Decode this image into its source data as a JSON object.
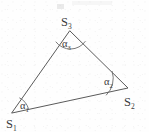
{
  "figure": {
    "background_color": "#fefefe",
    "line_color": "#5a5a5a",
    "text_color": "#3a3a3a",
    "width": 149,
    "height": 132
  },
  "vertices": [
    {
      "id": "S1",
      "base": "S",
      "subscript": "1",
      "x": 12,
      "y": 113,
      "label_x": 6,
      "label_y": 128
    },
    {
      "id": "S2",
      "base": "S",
      "subscript": "2",
      "x": 128,
      "y": 88,
      "label_x": 124,
      "label_y": 106
    },
    {
      "id": "S3",
      "base": "S",
      "subscript": "3",
      "x": 70,
      "y": 31,
      "label_x": 61,
      "label_y": 26
    }
  ],
  "angles": [
    {
      "id": "alpha1",
      "base": "α",
      "subscript": "1",
      "at_vertex": "S1",
      "label_x": 20,
      "label_y": 109,
      "arc_radius": 17
    },
    {
      "id": "alpha2",
      "base": "α",
      "subscript": "2",
      "at_vertex": "S2",
      "label_x": 104,
      "label_y": 85,
      "arc_radius": 23
    },
    {
      "id": "alpha3",
      "base": "α",
      "subscript": "3",
      "at_vertex": "S3",
      "label_x": 62,
      "label_y": 47,
      "arc_radius": 18
    }
  ],
  "edges": [
    {
      "id": "edge-S1-S2",
      "from": "S1",
      "to": "S2"
    },
    {
      "id": "edge-S2-S3",
      "from": "S2",
      "to": "S3"
    },
    {
      "id": "edge-S3-S1",
      "from": "S3",
      "to": "S1"
    }
  ],
  "paths": {
    "triangle": "M 12 113 L 128 88 L 70 31 Z",
    "arc_alpha1": "M 28.4 108.5 A 17 17 0 0 0 19.7 98.0",
    "arc_alpha2": "M 106.4 95.0 A 23 23 0 0 0 112.2 71.4",
    "arc_alpha3": "M 56.0 42.0 A 18 18 0 0 0 85.2 41.5"
  }
}
